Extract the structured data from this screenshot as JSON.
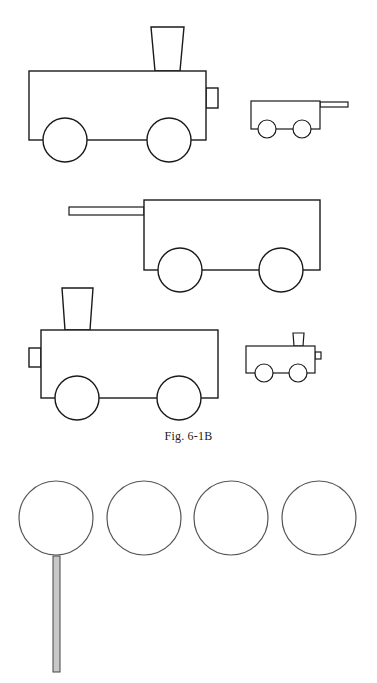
{
  "figure": {
    "caption": "Fig. 6-1B",
    "colors": {
      "stroke": "#1a1a1a",
      "circle_stroke": "#555555",
      "stick_fill": "#c8c8c8",
      "background": "#ffffff"
    },
    "shapes": [
      {
        "id": "engine-large-right",
        "type": "locomotive",
        "facing": "right",
        "size": "large"
      },
      {
        "id": "wagon-small",
        "type": "wagon",
        "handle_side": "right",
        "size": "small"
      },
      {
        "id": "wagon-large",
        "type": "wagon",
        "handle_side": "left",
        "size": "large"
      },
      {
        "id": "engine-large-left",
        "type": "locomotive",
        "facing": "left",
        "size": "large"
      },
      {
        "id": "engine-small",
        "type": "locomotive",
        "facing": "right",
        "size": "small"
      }
    ],
    "circles": {
      "count": 4,
      "one_with_stick": true
    }
  }
}
